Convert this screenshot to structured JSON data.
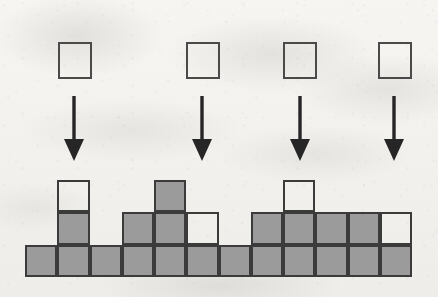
{
  "figure": {
    "background_color": "#f2f1ee",
    "fill_color": "#9b9b9b",
    "stroke_color": "#3b3b3b",
    "grid": {
      "columns": 12,
      "rows": 3,
      "origin_x": 25,
      "baseline_y": 277,
      "cell_width": 32.25,
      "cell_height": 32.5
    },
    "cells": [
      {
        "name": "r1c1",
        "col": 1,
        "row": 1,
        "state": "filled"
      },
      {
        "name": "r1c2",
        "col": 2,
        "row": 1,
        "state": "filled"
      },
      {
        "name": "r1c3",
        "col": 3,
        "row": 1,
        "state": "filled"
      },
      {
        "name": "r1c4",
        "col": 4,
        "row": 1,
        "state": "filled"
      },
      {
        "name": "r1c5",
        "col": 5,
        "row": 1,
        "state": "filled"
      },
      {
        "name": "r1c6",
        "col": 6,
        "row": 1,
        "state": "filled"
      },
      {
        "name": "r1c7",
        "col": 7,
        "row": 1,
        "state": "filled"
      },
      {
        "name": "r1c8",
        "col": 8,
        "row": 1,
        "state": "filled"
      },
      {
        "name": "r1c9",
        "col": 9,
        "row": 1,
        "state": "filled"
      },
      {
        "name": "r1c10",
        "col": 10,
        "row": 1,
        "state": "filled"
      },
      {
        "name": "r1c11",
        "col": 11,
        "row": 1,
        "state": "filled"
      },
      {
        "name": "r1c12",
        "col": 12,
        "row": 1,
        "state": "filled"
      },
      {
        "name": "r2c2",
        "col": 2,
        "row": 2,
        "state": "filled"
      },
      {
        "name": "r2c4",
        "col": 4,
        "row": 2,
        "state": "filled"
      },
      {
        "name": "r2c5",
        "col": 5,
        "row": 2,
        "state": "filled"
      },
      {
        "name": "r2c6",
        "col": 6,
        "row": 2,
        "state": "empty"
      },
      {
        "name": "r2c8",
        "col": 8,
        "row": 2,
        "state": "filled"
      },
      {
        "name": "r2c9",
        "col": 9,
        "row": 2,
        "state": "filled"
      },
      {
        "name": "r2c10",
        "col": 10,
        "row": 2,
        "state": "filled"
      },
      {
        "name": "r2c11",
        "col": 11,
        "row": 2,
        "state": "filled"
      },
      {
        "name": "r2c12",
        "col": 12,
        "row": 2,
        "state": "empty"
      },
      {
        "name": "r3c2",
        "col": 2,
        "row": 3,
        "state": "empty"
      },
      {
        "name": "r3c5",
        "col": 5,
        "row": 3,
        "state": "filled"
      },
      {
        "name": "r3c9",
        "col": 9,
        "row": 3,
        "state": "empty"
      }
    ],
    "column_heights": [
      1,
      3,
      1,
      2,
      3,
      2,
      1,
      2,
      3,
      2,
      2,
      2
    ],
    "falling_pieces": [
      {
        "name": "piece-1",
        "x": 58,
        "y": 42,
        "size": 34,
        "state": "empty",
        "target_column": 2
      },
      {
        "name": "piece-2",
        "x": 186,
        "y": 42,
        "size": 34,
        "state": "empty",
        "target_column": 6
      },
      {
        "name": "piece-3",
        "x": 283,
        "y": 42,
        "size": 34,
        "state": "empty",
        "target_column": 9
      },
      {
        "name": "piece-4",
        "x": 378,
        "y": 42,
        "size": 34,
        "state": "empty",
        "target_column": 12
      }
    ],
    "arrows": [
      {
        "name": "arrow-1",
        "x": 74,
        "y_top": 96,
        "y_bottom": 161
      },
      {
        "name": "arrow-2",
        "x": 202,
        "y_top": 96,
        "y_bottom": 161
      },
      {
        "name": "arrow-3",
        "x": 300,
        "y_top": 96,
        "y_bottom": 161
      },
      {
        "name": "arrow-4",
        "x": 394,
        "y_top": 96,
        "y_bottom": 161
      }
    ]
  },
  "chart_data": {
    "type": "bar",
    "xlabel": "",
    "ylabel": "",
    "ylim": [
      0,
      3
    ],
    "grid": false,
    "legend": "none",
    "categories": [
      "1",
      "2",
      "3",
      "4",
      "5",
      "6",
      "7",
      "8",
      "9",
      "10",
      "11",
      "12"
    ],
    "series": [
      {
        "name": "filled blocks",
        "values": [
          1,
          2,
          1,
          2,
          3,
          1,
          1,
          2,
          2,
          2,
          2,
          1
        ]
      },
      {
        "name": "empty blocks",
        "values": [
          0,
          1,
          0,
          0,
          0,
          1,
          0,
          0,
          1,
          0,
          0,
          1
        ]
      }
    ],
    "annotations": [
      "Four empty squares fall via downward arrows toward columns 2, 6, 9 and 12"
    ]
  }
}
